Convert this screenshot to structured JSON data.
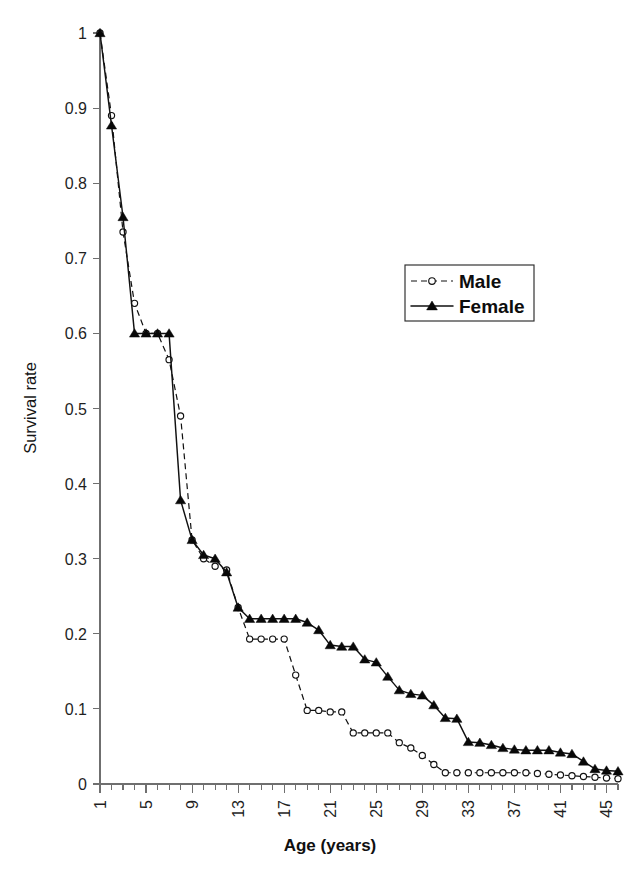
{
  "chart_data": {
    "type": "line",
    "title": "",
    "xlabel": "Age (years)",
    "ylabel": "Survival rate",
    "xlim": [
      1,
      46
    ],
    "ylim": [
      0,
      1
    ],
    "grid": false,
    "legend_position": "upper-right",
    "x_tick_labels": [
      "1",
      "5",
      "9",
      "13",
      "17",
      "21",
      "25",
      "29",
      "33",
      "37",
      "41",
      "45"
    ],
    "x_tick_values": [
      1,
      5,
      9,
      13,
      17,
      21,
      25,
      29,
      33,
      37,
      41,
      45
    ],
    "x_minor_tick_step": 1,
    "y_tick_labels": [
      "0",
      "0.1",
      "0.2",
      "0.3",
      "0.4",
      "0.5",
      "0.6",
      "0.7",
      "0.8",
      "0.9",
      "1"
    ],
    "y_tick_values": [
      0,
      0.1,
      0.2,
      0.3,
      0.4,
      0.5,
      0.6,
      0.7,
      0.8,
      0.9,
      1
    ],
    "x": [
      1,
      2,
      3,
      4,
      5,
      6,
      7,
      8,
      9,
      10,
      11,
      12,
      13,
      14,
      15,
      16,
      17,
      18,
      19,
      20,
      21,
      22,
      23,
      24,
      25,
      26,
      27,
      28,
      29,
      30,
      31,
      32,
      33,
      34,
      35,
      36,
      37,
      38,
      39,
      40,
      41,
      42,
      43,
      44,
      45,
      46
    ],
    "series": [
      {
        "name": "Male",
        "marker": "open-circle",
        "line_style": "dashed",
        "color": "#111111",
        "values": [
          1.0,
          0.89,
          0.735,
          0.64,
          0.6,
          0.6,
          0.565,
          0.49,
          0.325,
          0.3,
          0.29,
          0.285,
          0.235,
          0.193,
          0.193,
          0.193,
          0.193,
          0.145,
          0.098,
          0.098,
          0.096,
          0.096,
          0.068,
          0.068,
          0.068,
          0.068,
          0.055,
          0.048,
          0.038,
          0.026,
          0.015,
          0.015,
          0.015,
          0.015,
          0.015,
          0.015,
          0.015,
          0.015,
          0.014,
          0.013,
          0.012,
          0.011,
          0.01,
          0.009,
          0.008,
          0.007
        ]
      },
      {
        "name": "Female",
        "marker": "filled-triangle",
        "line_style": "solid",
        "color": "#111111",
        "values": [
          1.0,
          0.877,
          0.755,
          0.6,
          0.6,
          0.6,
          0.6,
          0.378,
          0.325,
          0.305,
          0.3,
          0.282,
          0.235,
          0.22,
          0.22,
          0.22,
          0.22,
          0.22,
          0.215,
          0.205,
          0.185,
          0.183,
          0.183,
          0.166,
          0.162,
          0.143,
          0.125,
          0.12,
          0.118,
          0.105,
          0.088,
          0.087,
          0.056,
          0.055,
          0.052,
          0.048,
          0.046,
          0.045,
          0.045,
          0.045,
          0.042,
          0.04,
          0.03,
          0.02,
          0.018,
          0.017
        ]
      }
    ]
  },
  "axes": {
    "x_title": "Age (years)",
    "y_title": "Survival rate"
  },
  "legend": {
    "items": [
      {
        "label": "Male",
        "marker": "open-circle",
        "style": "dashed"
      },
      {
        "label": "Female",
        "marker": "filled-triangle",
        "style": "solid"
      }
    ]
  },
  "colors": {
    "line": "#111111",
    "axis": "#6f6f6f",
    "text": "#1a1a1a",
    "background": "#ffffff"
  }
}
